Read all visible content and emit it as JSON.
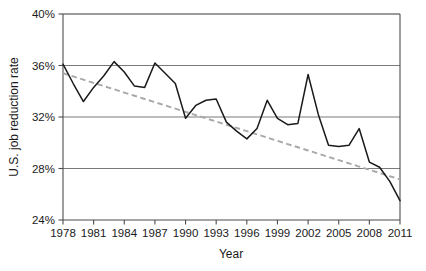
{
  "chart_data": {
    "type": "line",
    "title": "",
    "xlabel": "Year",
    "ylabel": "U.S. job reduction rate",
    "xlim": [
      1978,
      2011
    ],
    "ylim": [
      24,
      40
    ],
    "grid": true,
    "legend": "none",
    "y_tick_labels": [
      "24%",
      "28%",
      "32%",
      "36%",
      "40%"
    ],
    "y_tick_values": [
      24,
      28,
      32,
      36,
      40
    ],
    "x_tick_labels": [
      "1978",
      "1981",
      "1984",
      "1987",
      "1990",
      "1993",
      "1996",
      "1999",
      "2002",
      "2005",
      "2008",
      "2011"
    ],
    "x_tick_values": [
      1978,
      1981,
      1984,
      1987,
      1990,
      1993,
      1996,
      1999,
      2002,
      2005,
      2008,
      2011
    ],
    "x": [
      1978,
      1979,
      1980,
      1981,
      1982,
      1983,
      1984,
      1985,
      1986,
      1987,
      1988,
      1989,
      1990,
      1991,
      1992,
      1993,
      1994,
      1995,
      1996,
      1997,
      1998,
      1999,
      2000,
      2001,
      2002,
      2003,
      2004,
      2005,
      2006,
      2007,
      2008,
      2009,
      2010,
      2011
    ],
    "series": [
      {
        "name": "U.S. job reduction rate",
        "style": "solid",
        "color": "#1a1a1a",
        "values": [
          36.1,
          34.6,
          33.2,
          34.3,
          35.2,
          36.3,
          35.5,
          34.4,
          34.3,
          36.2,
          35.4,
          34.6,
          31.9,
          32.9,
          33.3,
          33.4,
          31.6,
          30.9,
          30.3,
          31.1,
          33.3,
          31.9,
          31.4,
          31.5,
          35.3,
          32.2,
          29.8,
          29.7,
          29.8,
          31.1,
          28.5,
          28.1,
          27.0,
          25.5
        ]
      },
      {
        "name": "Linear trend",
        "style": "dashed",
        "color": "#a8a8a8",
        "values": [
          35.4,
          35.15,
          34.9,
          34.65,
          34.4,
          34.15,
          33.9,
          33.65,
          33.4,
          33.15,
          32.9,
          32.65,
          32.4,
          32.15,
          31.9,
          31.65,
          31.4,
          31.15,
          30.9,
          30.65,
          30.4,
          30.15,
          29.9,
          29.65,
          29.4,
          29.15,
          28.9,
          28.65,
          28.4,
          28.15,
          27.9,
          27.65,
          27.4,
          27.15
        ]
      }
    ],
    "colors": {
      "data_line": "#1a1a1a",
      "trend_line": "#a8a8a8",
      "gridline": "#7a7a7a",
      "axis": "#4d4d4d",
      "background": "#ffffff"
    }
  }
}
